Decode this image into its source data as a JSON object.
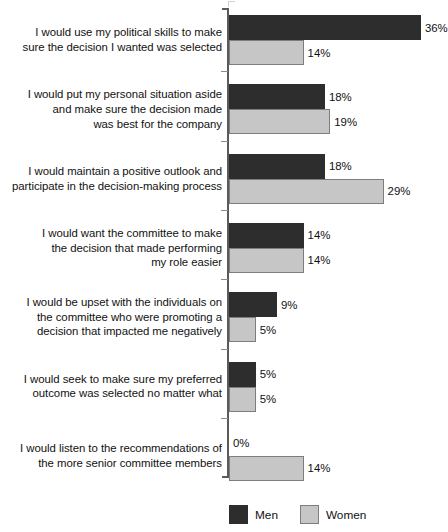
{
  "chart_data": {
    "type": "bar",
    "orientation": "horizontal",
    "title": "",
    "xlabel": "",
    "ylabel": "",
    "xlim": [
      0,
      36
    ],
    "grid": false,
    "legend_position": "bottom",
    "value_suffix": "%",
    "categories": [
      "I would use my political skills to make sure the decision I wanted was selected",
      "I would put my personal situation aside and make sure the decision made was best for the company",
      "I would maintain a positive outlook and participate in the decision-making process",
      "I would want the committee to make the decision that made performing my role easier",
      "I would be upset with the individuals on the committee who were promoting a decision that impacted me negatively",
      "I would seek to make sure my preferred outcome was selected no matter what",
      "I would listen to the recommendations of the more senior committee members"
    ],
    "category_lines": [
      [
        "I would use my political skills to make",
        "sure the decision I wanted was selected"
      ],
      [
        "I would put my personal situation aside",
        "and make sure the decision made",
        "was best for the company"
      ],
      [
        "I would maintain a positive outlook and",
        "participate in the decision-making process"
      ],
      [
        "I would want the committee to make",
        "the decision that made performing",
        "my role easier"
      ],
      [
        "I would be upset with the individuals on",
        "the committee who were promoting a",
        "decision that impacted me negatively"
      ],
      [
        "I would seek to make sure my preferred",
        "outcome was selected no matter what"
      ],
      [
        "I would listen to the recommendations of",
        "the more senior committee members"
      ]
    ],
    "series": [
      {
        "name": "Men",
        "color": "#2d2d2d",
        "values": [
          36,
          18,
          18,
          14,
          9,
          5,
          0
        ],
        "labels": [
          "36%",
          "18%",
          "18%",
          "14%",
          "9%",
          "5%",
          "0%"
        ]
      },
      {
        "name": "Women",
        "color": "#c6c6c6",
        "values": [
          14,
          19,
          29,
          14,
          5,
          5,
          14
        ],
        "labels": [
          "14%",
          "19%",
          "29%",
          "14%",
          "5%",
          "5%",
          "14%"
        ]
      }
    ]
  },
  "legend": {
    "items": [
      {
        "label": "Men",
        "swatch": "men-swatch"
      },
      {
        "label": "Women",
        "swatch": "women-swatch"
      }
    ]
  }
}
